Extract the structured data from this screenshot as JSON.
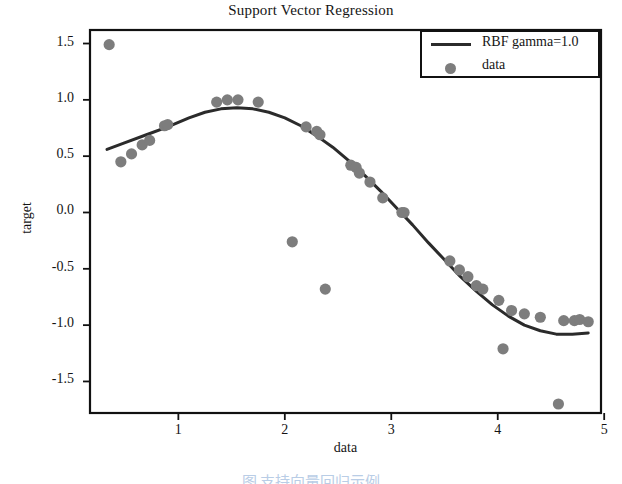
{
  "figure": {
    "title": "Support Vector Regression",
    "caption": "图    支持向量回归示例"
  },
  "legend": {
    "position": "upper-right",
    "entries": [
      {
        "label": "RBF gamma=1.0",
        "marker": "line",
        "color": "#2b2b2b"
      },
      {
        "label": "data",
        "marker": "circle",
        "color": "#7d7d7d"
      }
    ]
  },
  "axes": {
    "x_label": "data",
    "y_label": "target",
    "x_ticks": [
      "1",
      "2",
      "3",
      "4",
      "5"
    ],
    "y_ticks": [
      "1.5",
      "1.0",
      "0.5",
      "0.0",
      "-0.5",
      "-1.0",
      "-1.5"
    ]
  },
  "chart_data": {
    "type": "scatter",
    "title": "Support Vector Regression",
    "xlabel": "data",
    "ylabel": "target",
    "xlim": [
      0.17,
      4.97
    ],
    "ylim": [
      -1.78,
      1.62
    ],
    "grid": false,
    "legend_position": "upper right",
    "series": [
      {
        "name": "data",
        "type": "scatter",
        "marker": "circle",
        "color": "#7d7d7d",
        "points": [
          [
            0.35,
            1.49
          ],
          [
            0.46,
            0.45
          ],
          [
            0.56,
            0.52
          ],
          [
            0.66,
            0.6
          ],
          [
            0.73,
            0.64
          ],
          [
            0.87,
            0.77
          ],
          [
            0.9,
            0.78
          ],
          [
            1.36,
            0.98
          ],
          [
            1.46,
            1.0
          ],
          [
            1.56,
            1.0
          ],
          [
            1.75,
            0.98
          ],
          [
            2.07,
            -0.26
          ],
          [
            2.2,
            0.76
          ],
          [
            2.3,
            0.72
          ],
          [
            2.33,
            0.69
          ],
          [
            2.38,
            -0.68
          ],
          [
            2.62,
            0.42
          ],
          [
            2.67,
            0.4
          ],
          [
            2.7,
            0.35
          ],
          [
            2.8,
            0.27
          ],
          [
            2.92,
            0.13
          ],
          [
            3.1,
            0.0
          ],
          [
            3.12,
            0.0
          ],
          [
            3.55,
            -0.43
          ],
          [
            3.64,
            -0.51
          ],
          [
            3.72,
            -0.57
          ],
          [
            3.8,
            -0.65
          ],
          [
            3.86,
            -0.68
          ],
          [
            4.01,
            -0.78
          ],
          [
            4.05,
            -1.21
          ],
          [
            4.13,
            -0.87
          ],
          [
            4.25,
            -0.9
          ],
          [
            4.4,
            -0.93
          ],
          [
            4.57,
            -1.7
          ],
          [
            4.62,
            -0.96
          ],
          [
            4.72,
            -0.96
          ],
          [
            4.77,
            -0.95
          ],
          [
            4.85,
            -0.97
          ]
        ]
      },
      {
        "name": "RBF gamma=1.0",
        "type": "line",
        "color": "#2b2b2b",
        "points": [
          [
            0.33,
            0.56
          ],
          [
            0.5,
            0.62
          ],
          [
            0.7,
            0.69
          ],
          [
            0.9,
            0.76
          ],
          [
            1.1,
            0.84
          ],
          [
            1.25,
            0.89
          ],
          [
            1.4,
            0.92
          ],
          [
            1.55,
            0.93
          ],
          [
            1.7,
            0.92
          ],
          [
            1.85,
            0.89
          ],
          [
            2.0,
            0.84
          ],
          [
            2.15,
            0.77
          ],
          [
            2.3,
            0.68
          ],
          [
            2.45,
            0.58
          ],
          [
            2.6,
            0.46
          ],
          [
            2.75,
            0.33
          ],
          [
            2.9,
            0.19
          ],
          [
            3.05,
            0.04
          ],
          [
            3.2,
            -0.11
          ],
          [
            3.35,
            -0.27
          ],
          [
            3.5,
            -0.42
          ],
          [
            3.65,
            -0.57
          ],
          [
            3.8,
            -0.7
          ],
          [
            3.95,
            -0.82
          ],
          [
            4.1,
            -0.92
          ],
          [
            4.25,
            -1.0
          ],
          [
            4.4,
            -1.05
          ],
          [
            4.55,
            -1.08
          ],
          [
            4.7,
            -1.08
          ],
          [
            4.85,
            -1.07
          ]
        ]
      }
    ]
  }
}
